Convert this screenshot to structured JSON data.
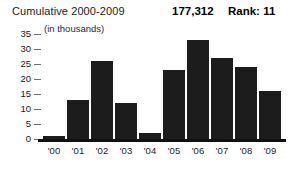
{
  "header": {
    "title": "Cumulative 2000-2009",
    "value": "177,312",
    "rank": "Rank: 11",
    "units_note": "(in thousands)"
  },
  "colors": {
    "bar": "#1c1c1c",
    "axis": "#111111",
    "tick": "#6e6e6e",
    "text": "#1a1a1a",
    "background": "#ffffff"
  },
  "chart_data": {
    "type": "bar",
    "title": "Cumulative 2000-2009",
    "subtitle": "(in thousands)",
    "xlabel": "",
    "ylabel": "",
    "categories": [
      "'00",
      "'01",
      "'02",
      "'03",
      "'04",
      "'05",
      "'06",
      "'07",
      "'08",
      "'09"
    ],
    "values": [
      1,
      13,
      26,
      12,
      2,
      23,
      33,
      27,
      24,
      16
    ],
    "ylim": [
      0,
      37
    ],
    "yticks": [
      0,
      5,
      10,
      15,
      20,
      25,
      30,
      35
    ],
    "ytick_labels": [
      "0",
      "5",
      "10",
      "15",
      "20",
      "25",
      "30",
      "35"
    ],
    "grid": false,
    "legend": null,
    "annotations": [
      {
        "label": "Cumulative total",
        "value": "177,312"
      },
      {
        "label": "Rank",
        "value": "11"
      }
    ]
  }
}
